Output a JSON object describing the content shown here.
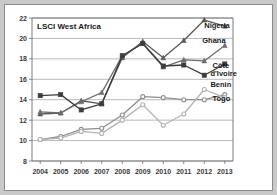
{
  "chart_data": {
    "type": "line",
    "title": "LSCI West Africa",
    "xlabel": "",
    "ylabel": "",
    "x": [
      2004,
      2005,
      2006,
      2007,
      2008,
      2009,
      2010,
      2011,
      2012,
      2013
    ],
    "categories": [
      "2004",
      "2005",
      "2006",
      "2007",
      "2008",
      "2009",
      "2010",
      "2011",
      "2012",
      "2013"
    ],
    "xlim": [
      2003.6,
      2013.4
    ],
    "ylim": [
      8,
      22
    ],
    "yticks": [
      8,
      10,
      12,
      14,
      16,
      18,
      20,
      22
    ],
    "ytick_labels": [
      "8",
      "10",
      "12",
      "14",
      "16",
      "18",
      "20",
      "22"
    ],
    "grid": "horizontal",
    "legend_position": "inline-right-labels",
    "series": [
      {
        "name": "Nigeria",
        "color": "#5a5a5a",
        "marker": "triangle",
        "values": [
          12.6,
          12.7,
          13.9,
          13.6,
          18.1,
          19.7,
          18.1,
          19.8,
          21.8,
          21.2
        ]
      },
      {
        "name": "Ghana",
        "color": "#6e6e6e",
        "marker": "triangle",
        "values": [
          12.8,
          12.7,
          13.8,
          14.7,
          18.3,
          19.5,
          17.2,
          17.9,
          17.8,
          19.3
        ]
      },
      {
        "name": "Côte d'Ivoire",
        "color": "#3c3c3c",
        "marker": "square",
        "values": [
          14.4,
          14.5,
          13.0,
          13.6,
          18.3,
          19.5,
          17.3,
          17.4,
          16.4,
          17.5
        ]
      },
      {
        "name": "Benin",
        "color": "#8e8e8e",
        "marker": "circle",
        "values": [
          10.1,
          10.4,
          11.1,
          11.2,
          12.5,
          14.3,
          14.2,
          14.0,
          14.0,
          14.5
        ]
      },
      {
        "name": "Togo",
        "color": "#b4b4b4",
        "marker": "circle",
        "values": [
          10.1,
          10.25,
          10.9,
          10.7,
          12.0,
          13.5,
          11.5,
          12.6,
          15.0,
          14.2
        ]
      }
    ],
    "series_labels": [
      {
        "text": "Nigeria",
        "x": 2012.0,
        "y": 21.0
      },
      {
        "text": "Ghana",
        "x": 2011.9,
        "y": 19.6
      },
      {
        "text": "Côte",
        "x": 2012.4,
        "y": 17.1
      },
      {
        "text": "d'Ivoire",
        "x": 2012.3,
        "y": 16.3
      },
      {
        "text": "Benin",
        "x": 2012.3,
        "y": 15.2
      },
      {
        "text": "Togo",
        "x": 2012.4,
        "y": 13.9
      }
    ]
  }
}
